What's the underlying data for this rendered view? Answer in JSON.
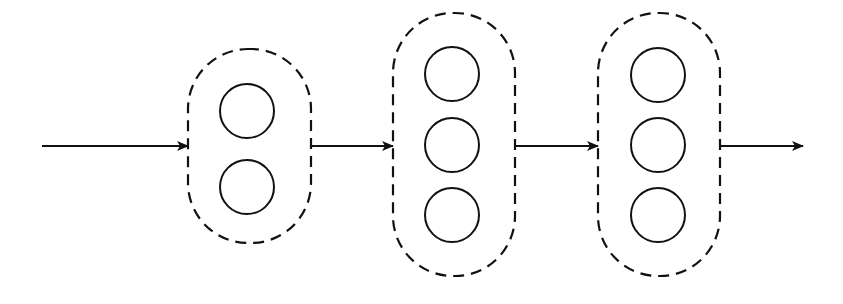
{
  "diagram": {
    "type": "layered-network-flow",
    "stroke_color": "#111111",
    "background": "#ffffff",
    "arrows": [
      {
        "id": "input-arrow",
        "x1": 42,
        "x2": 188,
        "y": 146
      },
      {
        "id": "arrow-1-2",
        "x1": 311,
        "x2": 393,
        "y": 146
      },
      {
        "id": "arrow-2-3",
        "x1": 515,
        "x2": 598,
        "y": 146
      },
      {
        "id": "output-arrow",
        "x1": 720,
        "x2": 803,
        "y": 146
      }
    ],
    "layers": [
      {
        "id": "layer-1",
        "x": 188,
        "y": 49,
        "w": 123,
        "h": 194,
        "rx": 60,
        "nodes": [
          {
            "cx": 247,
            "cy": 111,
            "r": 27
          },
          {
            "cx": 247,
            "cy": 187,
            "r": 27
          }
        ]
      },
      {
        "id": "layer-2",
        "x": 393,
        "y": 13,
        "w": 122,
        "h": 263,
        "rx": 60,
        "nodes": [
          {
            "cx": 452,
            "cy": 74,
            "r": 27
          },
          {
            "cx": 452,
            "cy": 145,
            "r": 27
          },
          {
            "cx": 452,
            "cy": 215,
            "r": 27
          }
        ]
      },
      {
        "id": "layer-3",
        "x": 598,
        "y": 13,
        "w": 122,
        "h": 263,
        "rx": 60,
        "nodes": [
          {
            "cx": 658,
            "cy": 75,
            "r": 27
          },
          {
            "cx": 658,
            "cy": 145,
            "r": 27
          },
          {
            "cx": 658,
            "cy": 215,
            "r": 27
          }
        ]
      }
    ]
  }
}
